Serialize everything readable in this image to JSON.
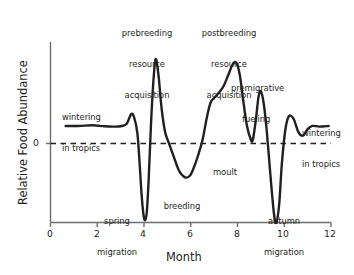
{
  "chart_data": {
    "type": "line",
    "title": "",
    "xlabel": "Month",
    "ylabel": "Relative Food Abundance",
    "xlim": [
      0,
      12
    ],
    "ylim": [
      -1.25,
      1.35
    ],
    "xticks": [
      "0",
      "2",
      "4",
      "6",
      "8",
      "10",
      "12"
    ],
    "xtick_values": [
      0,
      2,
      4,
      6,
      8,
      10,
      12
    ],
    "yticks": [
      "0"
    ],
    "ytick_values": [
      0
    ],
    "grid": false,
    "legend": false,
    "zero_line": "dashed",
    "series": [
      {
        "name": "Relative food abundance",
        "x": [
          0.65,
          1.2,
          1.8,
          2.3,
          2.7,
          3.0,
          3.25,
          3.45,
          3.58,
          3.72,
          3.82,
          3.9,
          3.98,
          4.05,
          4.12,
          4.2,
          4.3,
          4.4,
          4.5,
          4.62,
          4.75,
          4.9,
          5.05,
          5.25,
          5.5,
          5.75,
          5.95,
          6.1,
          6.3,
          6.5,
          6.7,
          6.85,
          7.0,
          7.2,
          7.4,
          7.6,
          7.8,
          7.95,
          8.1,
          8.25,
          8.4,
          8.55,
          8.65,
          8.78,
          8.9,
          9.0,
          9.12,
          9.25,
          9.4,
          9.55,
          9.65,
          9.78,
          9.9,
          10.05,
          10.2,
          10.4,
          10.6,
          10.8,
          11.0,
          11.2,
          11.5,
          11.9
        ],
        "y": [
          0.27,
          0.27,
          0.28,
          0.265,
          0.26,
          0.265,
          0.3,
          0.45,
          0.4,
          0.15,
          -0.35,
          -0.8,
          -1.1,
          -1.18,
          -1.05,
          -0.55,
          0.3,
          0.95,
          1.3,
          1.05,
          0.55,
          0.18,
          0.02,
          -0.18,
          -0.42,
          -0.52,
          -0.5,
          -0.4,
          -0.2,
          0.05,
          0.42,
          0.63,
          0.7,
          0.78,
          0.88,
          1.05,
          1.22,
          1.24,
          1.05,
          0.65,
          0.28,
          0.08,
          0.05,
          0.35,
          0.72,
          0.8,
          0.62,
          0.2,
          -0.45,
          -1.05,
          -1.22,
          -0.95,
          -0.3,
          0.22,
          0.42,
          0.38,
          0.18,
          0.12,
          0.22,
          0.27,
          0.26,
          0.27
        ]
      }
    ],
    "annotations": [
      {
        "id": "wintering-left",
        "text": "wintering\nin tropics",
        "lines": [
          "wintering",
          "in tropics"
        ],
        "x": 1.6,
        "y": 0.62,
        "align": "left"
      },
      {
        "id": "spring-migration",
        "text": "spring\nmigration",
        "lines": [
          "spring",
          "migration"
        ],
        "x": 2.9,
        "y": -0.95,
        "align": "center"
      },
      {
        "id": "prebreeding",
        "text": "prebreeding\nresource\nacquisition",
        "lines": [
          "prebreeding",
          "resource",
          "acquisition"
        ],
        "x": 4.5,
        "y": 1.72,
        "align": "center"
      },
      {
        "id": "breeding",
        "text": "breeding",
        "lines": [
          "breeding"
        ],
        "x": 6.0,
        "y": -0.78,
        "align": "center"
      },
      {
        "id": "postbreeding",
        "text": "postbreeding\nresource\nacquisition",
        "lines": [
          "postbreeding",
          "resource",
          "acquisition"
        ],
        "x": 7.8,
        "y": 1.72,
        "align": "center"
      },
      {
        "id": "moult",
        "text": "moult",
        "lines": [
          "moult"
        ],
        "x": 8.6,
        "y": -0.16,
        "align": "center"
      },
      {
        "id": "premigrative-fueling",
        "text": "premigrative\nfueling",
        "lines": [
          "premigrative",
          "fueling"
        ],
        "x": 9.9,
        "y": 1.12,
        "align": "center"
      },
      {
        "id": "autumn-migration",
        "text": "autumn\nmigration",
        "lines": [
          "autumn",
          "migration"
        ],
        "x": 10.7,
        "y": -0.95,
        "align": "center"
      },
      {
        "id": "wintering-right",
        "text": "wintering\nin tropics",
        "lines": [
          "wintering",
          "in tropics"
        ],
        "x": 12.3,
        "y": 0.4,
        "align": "left"
      }
    ],
    "colors": {
      "line": "#231f20",
      "axis": "#58585b",
      "text": "#231f20",
      "background": "#ffffff"
    }
  },
  "labels": {
    "ylabel": "Relative Food Abundance",
    "xlabel": "Month",
    "zero_tick": "0",
    "xtick_0": "0",
    "xtick_2": "2",
    "xtick_4": "4",
    "xtick_6": "6",
    "xtick_8": "8",
    "xtick_10": "10",
    "xtick_12": "12",
    "wintering_left_line1": "wintering",
    "wintering_left_line2": "in tropics",
    "spring_line1": "spring",
    "spring_line2": "migration",
    "prebreeding_line1": "prebreeding",
    "prebreeding_line2": "resource",
    "prebreeding_line3": "acquisition",
    "breeding": "breeding",
    "postbreeding_line1": "postbreeding",
    "postbreeding_line2": "resource",
    "postbreeding_line3": "acquisition",
    "moult": "moult",
    "premigrative_line1": "premigrative",
    "premigrative_line2": "fueling",
    "autumn_line1": "autumn",
    "autumn_line2": "migration",
    "wintering_right_line1": "wintering",
    "wintering_right_line2": "in tropics"
  }
}
